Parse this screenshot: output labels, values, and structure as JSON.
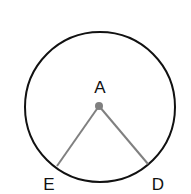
{
  "diagram": {
    "type": "circle-with-radii",
    "circle": {
      "cx": 100,
      "cy": 107,
      "r": 75,
      "stroke": "#111111"
    },
    "center": {
      "label": "A",
      "x": 99,
      "y": 106,
      "color": "#808080"
    },
    "points": [
      {
        "label": "E",
        "x": 57,
        "y": 166
      },
      {
        "label": "D",
        "x": 148,
        "y": 164
      }
    ],
    "segments": [
      {
        "from": "A",
        "to": "E",
        "color": "#808080"
      },
      {
        "from": "A",
        "to": "D",
        "color": "#808080"
      }
    ],
    "labels": {
      "a": "A",
      "e": "E",
      "d": "D"
    }
  }
}
